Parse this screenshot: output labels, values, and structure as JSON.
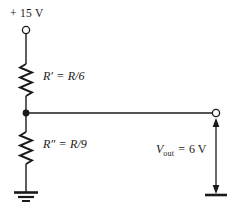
{
  "figure": {
    "type": "circuit-schematic",
    "background_color": "#ffffff",
    "line_color": "#1a1a1a"
  },
  "labels": {
    "supply": "+ 15 V",
    "resistor_top": {
      "symbol": "R′",
      "equals": "=",
      "value": "R/6",
      "full": "R′ = R/6"
    },
    "resistor_bottom": {
      "symbol": "R″",
      "equals": "=",
      "value": "R/9",
      "full": "R″ = R/9"
    },
    "output": {
      "symbol": "V",
      "subscript": "out",
      "equals": "=",
      "value": "6 V",
      "full": "V_out = 6 V"
    }
  },
  "nodes": {
    "supply_terminal": "open-circle-terminal",
    "divider_junction": "solid-junction-dot",
    "output_terminal": "open-circle-terminal",
    "ground_left": "ground-symbol",
    "ground_right": "ground-symbol"
  },
  "elements": {
    "top_resistor": "zigzag-resistor-vertical",
    "bottom_resistor": "zigzag-resistor-vertical",
    "output_arrow": "double-headed-vertical-arrow",
    "tap_wire": "horizontal-wire"
  }
}
